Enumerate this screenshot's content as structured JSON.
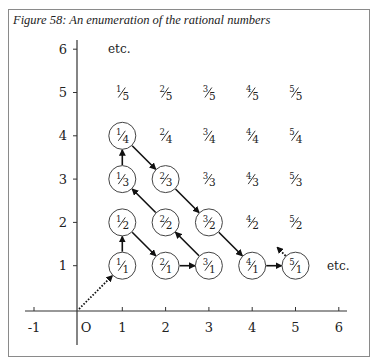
{
  "figure": {
    "caption": "Figure 58: An enumeration of the rational numbers"
  },
  "axes": {
    "x_ticks": [
      "-1",
      "O",
      "1",
      "2",
      "3",
      "4",
      "5",
      "6"
    ],
    "y_ticks": [
      "1",
      "2",
      "3",
      "4",
      "5",
      "6"
    ],
    "etc_top": "etc.",
    "etc_right": "etc."
  },
  "grid": {
    "rows": [
      {
        "den": "1",
        "cells": [
          {
            "num": "1",
            "circled": true
          },
          {
            "num": "2",
            "circled": true
          },
          {
            "num": "3",
            "circled": true
          },
          {
            "num": "4",
            "circled": true
          },
          {
            "num": "5",
            "circled": true
          }
        ]
      },
      {
        "den": "2",
        "cells": [
          {
            "num": "1",
            "circled": true
          },
          {
            "num": "2",
            "circled": true
          },
          {
            "num": "3",
            "circled": true
          },
          {
            "num": "4",
            "circled": false
          },
          {
            "num": "5",
            "circled": false
          }
        ]
      },
      {
        "den": "3",
        "cells": [
          {
            "num": "1",
            "circled": true
          },
          {
            "num": "2",
            "circled": true
          },
          {
            "num": "3",
            "circled": false
          },
          {
            "num": "4",
            "circled": false
          },
          {
            "num": "5",
            "circled": false
          }
        ]
      },
      {
        "den": "4",
        "cells": [
          {
            "num": "1",
            "circled": true
          },
          {
            "num": "2",
            "circled": false
          },
          {
            "num": "3",
            "circled": false
          },
          {
            "num": "4",
            "circled": false
          },
          {
            "num": "5",
            "circled": false
          }
        ]
      },
      {
        "den": "5",
        "cells": [
          {
            "num": "1",
            "circled": false
          },
          {
            "num": "2",
            "circled": false
          },
          {
            "num": "3",
            "circled": false
          },
          {
            "num": "4",
            "circled": false
          },
          {
            "num": "5",
            "circled": false
          }
        ]
      }
    ]
  },
  "path": {
    "description": "Enumeration path through circled fractions",
    "sequence": [
      "1/1",
      "1/2",
      "2/1",
      "3/1",
      "2/2",
      "1/3",
      "1/4",
      "2/3",
      "3/2",
      "4/1",
      "5/1"
    ],
    "start_dotted_from": "origin",
    "end_dotted_toward": "upper-left"
  }
}
